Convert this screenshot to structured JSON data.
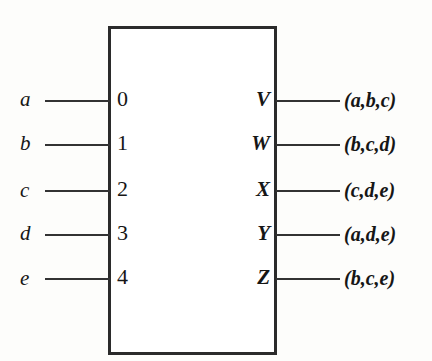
{
  "diagram": {
    "kind": "logic-block-diagram",
    "box": {
      "border_color": "#2b2b2b",
      "fill_color": "#ffffff"
    },
    "background_color": "#fdfdfb",
    "wire_color": "#333333",
    "rows": [
      {
        "input_label": "a",
        "pin_number": "0",
        "output_label": "V",
        "output_expression": "(a,b,c)"
      },
      {
        "input_label": "b",
        "pin_number": "1",
        "output_label": "W",
        "output_expression": "(b,c,d)"
      },
      {
        "input_label": "c",
        "pin_number": "2",
        "output_label": "X",
        "output_expression": "(c,d,e)"
      },
      {
        "input_label": "d",
        "pin_number": "3",
        "output_label": "Y",
        "output_expression": "(a,d,e)"
      },
      {
        "input_label": "e",
        "pin_number": "4",
        "output_label": "Z",
        "output_expression": "(b,c,e)"
      }
    ]
  }
}
